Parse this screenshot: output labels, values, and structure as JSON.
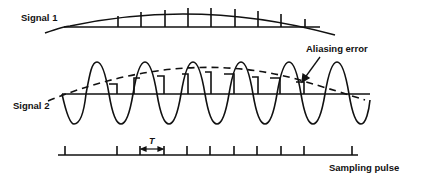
{
  "labels": {
    "signal1": "Signal 1",
    "signal2": "Signal 2",
    "aliasing": "Aliasing error",
    "period": "T",
    "sampling": "Sampling pulse"
  },
  "colors": {
    "stroke": "#111111",
    "background": "#ffffff"
  },
  "diagram": {
    "signal1": {
      "type": "slow-arc",
      "sample_lines": 9
    },
    "signal2": {
      "type": "fast-sine",
      "cycles_visible": 6,
      "aliased_reconstruction": "dashed-slow-arc"
    },
    "sampling_pulse": {
      "ticks": 11,
      "marked_interval": "T"
    }
  }
}
